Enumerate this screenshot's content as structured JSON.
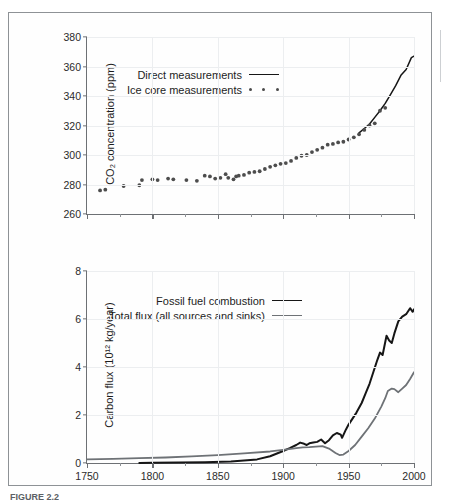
{
  "figure": {
    "caption": "FIGURE 2.2",
    "background": "#ffffff",
    "border_color": "#8e9296"
  },
  "colors": {
    "direct_line": "#161616",
    "ice_core_dots": "#4d4d4d",
    "fossil_fuel": "#161616",
    "total_flux": "#6e7276",
    "grid": "#eceef0",
    "axis": "#6d7074"
  },
  "chart_data": [
    {
      "type": "scatter",
      "panel": "top",
      "title": "",
      "xlabel": "",
      "ylabel": "CO₂ concentration (ppm)",
      "xlim": [
        1750,
        2000
      ],
      "ylim": [
        260,
        380
      ],
      "yticks": [
        260,
        280,
        300,
        320,
        340,
        360,
        380
      ],
      "xticks": [
        1750,
        1800,
        1850,
        1900,
        1950,
        2000
      ],
      "xticks_minor": [
        1775,
        1825,
        1875,
        1925,
        1975
      ],
      "grid": true,
      "legend_position": "upper-left-inset",
      "series": [
        {
          "name": "Direct measurements",
          "marker": "line",
          "x": [
            1958,
            1962,
            1966,
            1970,
            1974,
            1978,
            1982,
            1986,
            1990,
            1994,
            1998,
            2000
          ],
          "values": [
            315,
            318,
            321,
            325.5,
            330,
            335,
            341,
            347,
            354,
            358,
            366,
            367
          ]
        },
        {
          "name": "Ice core measurements",
          "marker": "dots",
          "x": [
            1760,
            1764,
            1778,
            1790,
            1792,
            1800,
            1804,
            1812,
            1816,
            1826,
            1834,
            1840,
            1844,
            1848,
            1852,
            1856,
            1858,
            1862,
            1864,
            1866,
            1870,
            1874,
            1878,
            1882,
            1886,
            1890,
            1894,
            1898,
            1902,
            1906,
            1910,
            1914,
            1918,
            1922,
            1926,
            1930,
            1934,
            1938,
            1942,
            1946,
            1950,
            1954,
            1958,
            1962,
            1966,
            1970,
            1974,
            1978
          ],
          "values": [
            276,
            276.5,
            279,
            279.5,
            283,
            283.5,
            283,
            284,
            283.5,
            283,
            282.5,
            286,
            285.5,
            284,
            284.5,
            287,
            284.5,
            283.5,
            285.5,
            286,
            286.5,
            288,
            288.5,
            289,
            290.5,
            292,
            293,
            294,
            294.5,
            296,
            298,
            299.5,
            300,
            302,
            303.5,
            305,
            307,
            307.5,
            308.5,
            309,
            310.5,
            312,
            314,
            317,
            320,
            321.5,
            330,
            332
          ]
        }
      ]
    },
    {
      "type": "line",
      "panel": "bottom",
      "title": "",
      "xlabel": "",
      "ylabel": "Carbon flux (10¹² kg/year)",
      "xlim": [
        1750,
        2000
      ],
      "ylim": [
        0,
        8
      ],
      "yticks": [
        0,
        2,
        4,
        6,
        8
      ],
      "xticks": [
        1750,
        1800,
        1850,
        1900,
        1950,
        2000
      ],
      "xticks_minor": [
        1775,
        1825,
        1875,
        1925,
        1975
      ],
      "grid": true,
      "legend_position": "upper-left-inset",
      "series": [
        {
          "name": "Fossil fuel combustion",
          "x": [
            1790,
            1800,
            1820,
            1840,
            1860,
            1870,
            1880,
            1890,
            1900,
            1905,
            1910,
            1913,
            1916,
            1918,
            1920,
            1923,
            1926,
            1929,
            1932,
            1935,
            1938,
            1941,
            1944,
            1945,
            1948,
            1950,
            1953,
            1956,
            1960,
            1963,
            1966,
            1969,
            1972,
            1974,
            1976,
            1979,
            1981,
            1983,
            1985,
            1988,
            1991,
            1994,
            1997,
            1999,
            2000
          ],
          "values": [
            0.0,
            0.01,
            0.02,
            0.03,
            0.06,
            0.1,
            0.15,
            0.28,
            0.5,
            0.62,
            0.75,
            0.85,
            0.8,
            0.75,
            0.82,
            0.85,
            0.88,
            0.98,
            0.82,
            0.95,
            1.15,
            1.25,
            1.18,
            1.05,
            1.4,
            1.6,
            1.85,
            2.1,
            2.5,
            2.9,
            3.3,
            3.8,
            4.3,
            4.6,
            4.5,
            5.3,
            5.1,
            5.0,
            5.4,
            5.9,
            6.1,
            6.2,
            6.45,
            6.3,
            6.4
          ]
        },
        {
          "name": "Total flux (all sources and sinks)",
          "x": [
            1750,
            1770,
            1790,
            1810,
            1830,
            1850,
            1870,
            1890,
            1900,
            1910,
            1915,
            1920,
            1925,
            1930,
            1935,
            1940,
            1943,
            1946,
            1950,
            1955,
            1960,
            1965,
            1970,
            1975,
            1978,
            1980,
            1983,
            1985,
            1988,
            1991,
            1994,
            1997,
            2000
          ],
          "values": [
            0.15,
            0.17,
            0.2,
            0.23,
            0.28,
            0.33,
            0.4,
            0.48,
            0.55,
            0.62,
            0.65,
            0.66,
            0.68,
            0.7,
            0.6,
            0.42,
            0.33,
            0.35,
            0.5,
            0.75,
            1.1,
            1.45,
            1.85,
            2.35,
            2.7,
            3.0,
            3.1,
            3.08,
            2.95,
            3.1,
            3.25,
            3.5,
            3.78
          ]
        }
      ]
    }
  ]
}
